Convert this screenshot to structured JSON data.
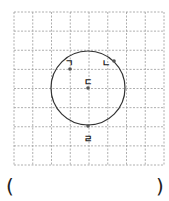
{
  "figure": {
    "grid": {
      "x0": 14,
      "y0": 12,
      "x1": 164,
      "y1": 165,
      "cols": 8,
      "rows": 8,
      "color": "#9a9a9a"
    },
    "circle": {
      "cx": 88,
      "cy": 88,
      "r": 37,
      "stroke": "#333333"
    },
    "points": [
      {
        "label": "ㄱ",
        "x": 70,
        "y": 69,
        "lx": 69,
        "ly": 63
      },
      {
        "label": "ㄴ",
        "x": 114,
        "y": 61,
        "lx": 106,
        "ly": 63
      },
      {
        "label": "ㄷ",
        "x": 88,
        "y": 88,
        "lx": 88,
        "ly": 82
      },
      {
        "label": "ㄹ",
        "x": 88,
        "y": 126,
        "lx": 88,
        "ly": 139
      }
    ]
  },
  "answer": {
    "open": "(",
    "close": ")",
    "value": ""
  }
}
